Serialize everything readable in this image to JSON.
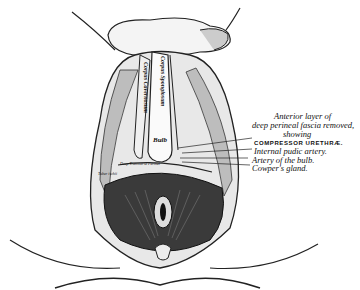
{
  "figure": {
    "annotations": {
      "heading_line1": "Anterior layer of",
      "heading_line2": "deep perineal fascia removed,",
      "heading_line3": "showing",
      "compressor": "COMPRESSOR URETHRÆ.",
      "internal_pudic": "Internal pudic artery.",
      "artery_bulb": "Artery of the bulb.",
      "coupers_gland": "Cowper's gland."
    },
    "inline_labels": {
      "corpus_spongiosum": "Corpus Spongiosum",
      "corpus_cavernosum": "Corpus Cavernosum",
      "bulb": "Bulb",
      "deep_transverse": "Deep Transverse Perinei",
      "tuber": "Tuber ischii"
    }
  }
}
